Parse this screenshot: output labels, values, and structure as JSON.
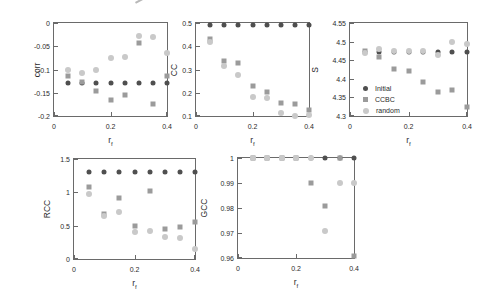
{
  "figure": {
    "background": "#ffffff",
    "axis_color": "#6a6a6a",
    "text_color": "#2b2b2b"
  },
  "legend": {
    "entries": [
      "Initial",
      "CCBC",
      "random"
    ],
    "position": "inside lower-left of S plot"
  },
  "series_styles": {
    "initial_color": "#4f4f4f",
    "ccbc_color": "#9b9b9b",
    "random_color": "#c9c9c9"
  },
  "chart_data": [
    {
      "id": "corr",
      "type": "scatter",
      "ylabel": "corr",
      "xlabel": "r_f",
      "xlim": [
        0,
        0.4
      ],
      "ylim": [
        -0.2,
        0
      ],
      "xtick_labels": [
        "0",
        "0.2",
        "0.4"
      ],
      "ytick_labels": [
        "0",
        "-0.05",
        "-0.1",
        "-0.15",
        "-0.2"
      ],
      "x": [
        0.05,
        0.1,
        0.15,
        0.2,
        0.25,
        0.3,
        0.35,
        0.4
      ],
      "series": [
        {
          "name": "Initial",
          "marker": "circle",
          "color": "#4f4f4f",
          "values": [
            -0.128,
            -0.128,
            -0.128,
            -0.128,
            -0.128,
            -0.128,
            -0.128,
            -0.128
          ]
        },
        {
          "name": "CCBC",
          "marker": "square",
          "color": "#9b9b9b",
          "values": [
            -0.115,
            -0.127,
            -0.146,
            -0.165,
            -0.154,
            -0.043,
            -0.175,
            -0.115
          ]
        },
        {
          "name": "random",
          "marker": "circle",
          "color": "#c9c9c9",
          "values": [
            -0.1,
            -0.108,
            -0.1,
            -0.076,
            -0.073,
            -0.028,
            -0.03,
            -0.065
          ]
        }
      ],
      "legend": false
    },
    {
      "id": "cc",
      "type": "scatter",
      "ylabel": "CC",
      "xlabel": "r_f",
      "xlim": [
        0,
        0.4
      ],
      "ylim": [
        0.1,
        0.5
      ],
      "xtick_labels": [
        "0",
        "0.2",
        "0.4"
      ],
      "ytick_labels": [
        "0.5",
        "0.4",
        "0.3",
        "0.2",
        "0.1"
      ],
      "x": [
        0.05,
        0.1,
        0.15,
        0.2,
        0.25,
        0.3,
        0.35,
        0.4
      ],
      "series": [
        {
          "name": "Initial",
          "marker": "circle",
          "color": "#4f4f4f",
          "values": [
            0.493,
            0.493,
            0.493,
            0.493,
            0.493,
            0.493,
            0.493,
            0.493
          ]
        },
        {
          "name": "CCBC",
          "marker": "square",
          "color": "#9b9b9b",
          "values": [
            0.43,
            0.335,
            0.33,
            0.228,
            0.203,
            0.155,
            0.15,
            0.127
          ]
        },
        {
          "name": "random",
          "marker": "circle",
          "color": "#c9c9c9",
          "values": [
            0.42,
            0.316,
            0.278,
            0.182,
            0.178,
            0.113,
            0.1,
            0.105
          ]
        }
      ],
      "legend": false
    },
    {
      "id": "s",
      "type": "scatter",
      "ylabel": "S",
      "xlabel": "r_f",
      "xlim": [
        0,
        0.4
      ],
      "ylim": [
        4.3,
        4.55
      ],
      "xtick_labels": [
        "0",
        "0.2",
        "0.4"
      ],
      "ytick_labels": [
        "4.55",
        "4.5",
        "4.45",
        "4.4",
        "4.35",
        "4.3"
      ],
      "x": [
        0.05,
        0.1,
        0.15,
        0.2,
        0.25,
        0.3,
        0.35,
        0.4
      ],
      "series": [
        {
          "name": "Initial",
          "marker": "circle",
          "color": "#4f4f4f",
          "values": [
            4.473,
            4.473,
            4.473,
            4.473,
            4.473,
            4.473,
            4.473,
            4.473
          ]
        },
        {
          "name": "CCBC",
          "marker": "square",
          "color": "#9b9b9b",
          "values": [
            4.474,
            4.458,
            4.426,
            4.42,
            4.391,
            4.364,
            4.37,
            4.325
          ]
        },
        {
          "name": "random",
          "marker": "circle",
          "color": "#c9c9c9",
          "values": [
            4.47,
            4.48,
            4.476,
            4.474,
            4.475,
            4.464,
            4.5,
            4.494
          ]
        }
      ],
      "legend": true
    },
    {
      "id": "rcc",
      "type": "scatter",
      "ylabel": "RCC",
      "xlabel": "r_f",
      "xlim": [
        0,
        0.4
      ],
      "ylim": [
        0,
        1.5
      ],
      "xtick_labels": [
        "0",
        "0.2",
        "0.4"
      ],
      "ytick_labels": [
        "1.5",
        "1",
        "0.5",
        "0"
      ],
      "x": [
        0.05,
        0.1,
        0.15,
        0.2,
        0.25,
        0.3,
        0.35,
        0.4
      ],
      "series": [
        {
          "name": "Initial",
          "marker": "circle",
          "color": "#4f4f4f",
          "values": [
            1.3,
            1.3,
            1.3,
            1.3,
            1.3,
            1.3,
            1.3,
            1.3
          ]
        },
        {
          "name": "CCBC",
          "marker": "square",
          "color": "#9b9b9b",
          "values": [
            1.08,
            0.67,
            0.91,
            0.49,
            1.02,
            0.45,
            0.48,
            0.56
          ]
        },
        {
          "name": "random",
          "marker": "circle",
          "color": "#c9c9c9",
          "values": [
            0.97,
            0.64,
            0.71,
            0.41,
            0.42,
            0.33,
            0.31,
            0.15
          ]
        }
      ],
      "legend": false
    },
    {
      "id": "gcc",
      "type": "scatter",
      "ylabel": "GCC",
      "xlabel": "r_f",
      "xlim": [
        0,
        0.4
      ],
      "ylim": [
        0.96,
        1
      ],
      "xtick_labels": [
        "0",
        "0.2",
        "0.4"
      ],
      "ytick_labels": [
        "1",
        "0.99",
        "0.98",
        "0.97",
        "0.96"
      ],
      "x": [
        0.05,
        0.1,
        0.15,
        0.2,
        0.25,
        0.3,
        0.35,
        0.4
      ],
      "series": [
        {
          "name": "Initial",
          "marker": "circle",
          "color": "#4f4f4f",
          "values": [
            1.0,
            1.0,
            1.0,
            1.0,
            1.0,
            1.0,
            1.0,
            1.0
          ]
        },
        {
          "name": "CCBC",
          "marker": "square",
          "color": "#9b9b9b",
          "values": [
            1.0,
            1.0,
            1.0,
            1.0,
            0.99,
            0.981,
            1.0,
            0.961
          ]
        },
        {
          "name": "random",
          "marker": "circle",
          "color": "#c9c9c9",
          "values": [
            1.0,
            1.0,
            1.0,
            1.0,
            1.0,
            0.971,
            0.99,
            0.99
          ]
        }
      ],
      "legend": false
    }
  ]
}
